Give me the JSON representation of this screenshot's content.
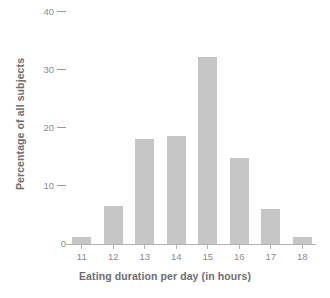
{
  "chart_data": {
    "type": "bar",
    "title": "",
    "xlabel": "Eating duration per day (in hours)",
    "ylabel": "Percentage of all subjects",
    "categories": [
      "11",
      "12",
      "13",
      "14",
      "15",
      "16",
      "17",
      "18"
    ],
    "values": [
      1.2,
      6.6,
      18.1,
      18.6,
      32.2,
      14.8,
      6.1,
      1.2
    ],
    "ylim": [
      0,
      40
    ],
    "yticks": [
      "0",
      "10",
      "20",
      "30",
      "40"
    ],
    "ytick_values": [
      0,
      10,
      20,
      30,
      40
    ],
    "xticks": [
      "11",
      "12",
      "13",
      "14",
      "15",
      "16",
      "17",
      "18"
    ],
    "grid": false,
    "legend": false,
    "bar_color": "#c6c6c6",
    "axis_color": "#b3b3b3",
    "tick_label_color": "#8c8c8c",
    "axis_title_color": "#6e6e6e",
    "background_color": "#ffffff"
  }
}
